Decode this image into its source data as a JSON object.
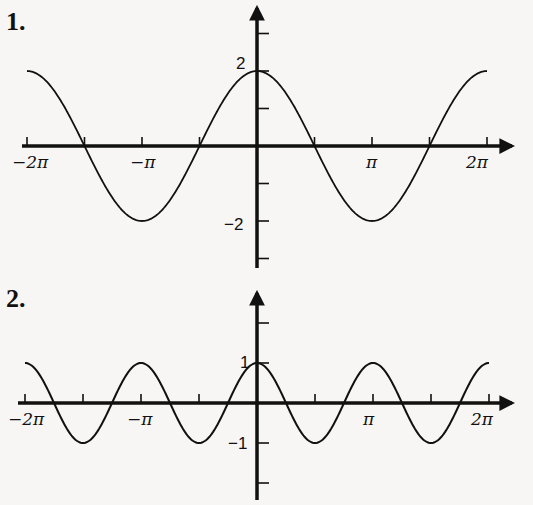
{
  "chart_data": [
    {
      "type": "line",
      "number_label": "1.",
      "function": "2cos(x)",
      "amplitude": 2,
      "period": "2π",
      "xlim": [
        "-2π",
        "2π"
      ],
      "ylim": [
        -3,
        3
      ],
      "x_tick_labels": [
        "-2π",
        "-π",
        "π",
        "2π"
      ],
      "x_ticks_every": "π/2",
      "y_tick_labels": [
        "2",
        "-2"
      ],
      "y_ticks": [
        3,
        2,
        1,
        -1,
        -2,
        -3
      ],
      "points": [
        {
          "x": "-2π",
          "y": 2
        },
        {
          "x": "-3π/2",
          "y": 0
        },
        {
          "x": "-π",
          "y": -2
        },
        {
          "x": "-π/2",
          "y": 0
        },
        {
          "x": "0",
          "y": 2
        },
        {
          "x": "π/2",
          "y": 0
        },
        {
          "x": "π",
          "y": -2
        },
        {
          "x": "3π/2",
          "y": 0
        },
        {
          "x": "2π",
          "y": 2
        }
      ],
      "grid": false,
      "geom": {
        "ox": 257,
        "oy": 146,
        "pi_px": 115,
        "unit_px": 37.5,
        "x_from": -6.2832,
        "x_to": 6.2832,
        "amp": 2,
        "freq": 1,
        "yaxis_top": 8,
        "yaxis_bottom": 268,
        "xaxis_left": 22,
        "xaxis_right": 512
      }
    },
    {
      "type": "line",
      "number_label": "2.",
      "function": "cos(2x)",
      "amplitude": 1,
      "period": "π",
      "xlim": [
        "-2π",
        "2π"
      ],
      "ylim": [
        -2,
        2
      ],
      "x_tick_labels": [
        "-2π",
        "-π",
        "π",
        "2π"
      ],
      "x_ticks_every": "π/2",
      "y_tick_labels": [
        "1",
        "-1"
      ],
      "y_ticks": [
        2,
        1,
        -1,
        -2
      ],
      "points": [
        {
          "x": "-2π",
          "y": 1
        },
        {
          "x": "-3π/2",
          "y": -1
        },
        {
          "x": "-π",
          "y": 1
        },
        {
          "x": "-π/2",
          "y": -1
        },
        {
          "x": "0",
          "y": 1
        },
        {
          "x": "π/2",
          "y": -1
        },
        {
          "x": "π",
          "y": 1
        },
        {
          "x": "3π/2",
          "y": -1
        },
        {
          "x": "2π",
          "y": 1
        }
      ],
      "grid": false,
      "geom": {
        "ox": 257,
        "oy": 403,
        "pi_px": 116,
        "unit_px": 40,
        "x_from": -6.2832,
        "x_to": 6.2832,
        "amp": 1,
        "freq": 2,
        "yaxis_top": 293,
        "yaxis_bottom": 500,
        "xaxis_left": 18,
        "xaxis_right": 512
      }
    }
  ]
}
